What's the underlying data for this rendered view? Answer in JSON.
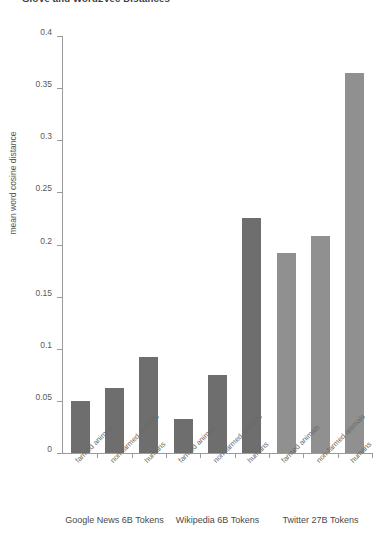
{
  "figure": {
    "heading": "GloVe and Word2Vec Distances"
  },
  "chart_data": {
    "type": "bar",
    "title": "",
    "xlabel": "",
    "ylabel": "mean word cosine distance",
    "ylim": [
      0,
      0.4
    ],
    "ytick_labels": [
      "0",
      "0.05",
      "0.1",
      "0.15",
      "0.2",
      "0.25",
      "0.3",
      "0.35",
      "0.4"
    ],
    "ytick_values": [
      0,
      0.05,
      0.1,
      0.15,
      0.2,
      0.25,
      0.3,
      0.35,
      0.4
    ],
    "grid": false,
    "legend": "none",
    "categories": [
      "farmed animals",
      "non-farmed animals",
      "humans",
      "farmed animals",
      "non-farmed animals",
      "humans",
      "farmed animals",
      "non-farmed animals",
      "humans"
    ],
    "values": [
      0.05,
      0.062,
      0.092,
      0.033,
      0.075,
      0.225,
      0.192,
      0.208,
      0.365
    ],
    "bar_colors": [
      "#6e6e6e",
      "#6e6e6e",
      "#6e6e6e",
      "#6e6e6e",
      "#6e6e6e",
      "#6e6e6e",
      "#909090",
      "#909090",
      "#909090"
    ],
    "groups": [
      {
        "label": "Google News 6B Tokens",
        "categories": [
          "farmed animals",
          "non-farmed animals",
          "humans"
        ],
        "values": [
          0.05,
          0.062,
          0.092
        ]
      },
      {
        "label": "Wikipedia 6B Tokens",
        "categories": [
          "farmed animals",
          "non-farmed animals",
          "humans"
        ],
        "values": [
          0.033,
          0.075,
          0.225
        ]
      },
      {
        "label": "Twitter 27B Tokens",
        "categories": [
          "farmed animals",
          "non-farmed animals",
          "humans"
        ],
        "values": [
          0.192,
          0.208,
          0.365
        ]
      }
    ]
  }
}
